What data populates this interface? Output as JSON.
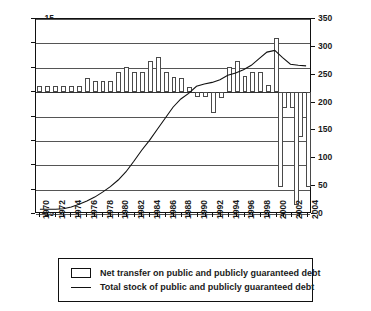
{
  "chart_data": {
    "type": "bar",
    "title": "",
    "subtitle": "",
    "xlabel": "",
    "ylabel": "",
    "grid": true,
    "legend_position": "bottom",
    "x": [
      1970,
      1971,
      1972,
      1973,
      1974,
      1975,
      1976,
      1977,
      1978,
      1979,
      1980,
      1981,
      1982,
      1983,
      1984,
      1985,
      1986,
      1987,
      1988,
      1989,
      1990,
      1991,
      1992,
      1993,
      1994,
      1995,
      1996,
      1997,
      1998,
      1999,
      2000,
      2001,
      2002,
      2003,
      2004
    ],
    "categories": [
      "1970",
      "1971",
      "1972",
      "1973",
      "1974",
      "1975",
      "1976",
      "1977",
      "1978",
      "1979",
      "1980",
      "1981",
      "1982",
      "1983",
      "1984",
      "1985",
      "1986",
      "1987",
      "1988",
      "1989",
      "1990",
      "1991",
      "1992",
      "1993",
      "1994",
      "1995",
      "1996",
      "1997",
      "1998",
      "1999",
      "2000",
      "2001",
      "2002",
      "2003",
      "2004"
    ],
    "xtick_labels": [
      "1970",
      "1972",
      "1974",
      "1976",
      "1978",
      "1980",
      "1982",
      "1984",
      "1986",
      "1988",
      "1990",
      "1992",
      "1994",
      "1996",
      "1998",
      "2000",
      "2002",
      "2004"
    ],
    "left_axis": {
      "ticks": [
        15,
        10,
        5,
        0,
        -5,
        -10,
        -15,
        -20,
        -25
      ],
      "tick_labels": [
        "15",
        "10",
        "5",
        "0",
        "-5",
        "-10",
        "-15",
        "-20",
        "-25"
      ],
      "ylim": [
        -25,
        15
      ]
    },
    "right_axis": {
      "ticks": [
        350,
        300,
        250,
        200,
        150,
        100,
        50,
        0
      ],
      "tick_labels": [
        "350",
        "300",
        "250",
        "200",
        "150",
        "100",
        "50",
        "0"
      ],
      "ylim": [
        0,
        350
      ]
    },
    "series": [
      {
        "name": "Net transfer on public and publicly guaranteed debt",
        "type": "bar",
        "axis": "left",
        "values": [
          1.2,
          1.2,
          1.2,
          1.2,
          1.2,
          1.2,
          3.0,
          2.2,
          2.3,
          2.3,
          4.1,
          5.2,
          4.1,
          4.1,
          6.3,
          7.2,
          4.1,
          3.1,
          2.8,
          1.1,
          -1.0,
          -0.9,
          -4.3,
          -1.3,
          5.2,
          6.3,
          3.3,
          4.1,
          4.1,
          1.4,
          11.2,
          -3.2,
          -3.3,
          -9.2,
          -11.1
        ]
      },
      {
        "name": "Total stock of public and publicly guaranteed debt",
        "type": "line",
        "axis": "right",
        "values": [
          5,
          5,
          5,
          6,
          9,
          14,
          20,
          27,
          36,
          46,
          58,
          73,
          92,
          112,
          130,
          150,
          170,
          190,
          205,
          215,
          228,
          232,
          235,
          240,
          248,
          252,
          258,
          266,
          278,
          290,
          293,
          280,
          268,
          266,
          265
        ]
      }
    ],
    "bars_by_year": [
      {
        "year": "1970",
        "value": 1.2
      },
      {
        "year": "1971",
        "value": 1.2
      },
      {
        "year": "1972",
        "value": 1.2
      },
      {
        "year": "1973",
        "value": 1.2
      },
      {
        "year": "1974",
        "value": 1.2
      },
      {
        "year": "1975",
        "value": 1.2
      },
      {
        "year": "1976",
        "value": 3.0
      },
      {
        "year": "1977",
        "value": 2.2
      },
      {
        "year": "1978",
        "value": 2.3
      },
      {
        "year": "1979",
        "value": 2.3
      },
      {
        "year": "1980",
        "value": 4.1
      },
      {
        "year": "1981",
        "value": 5.2
      },
      {
        "year": "1982",
        "value": 4.1
      },
      {
        "year": "1983",
        "value": 4.1
      },
      {
        "year": "1984",
        "value": 6.3
      },
      {
        "year": "1985",
        "value": 7.2
      },
      {
        "year": "1986",
        "value": 4.1
      },
      {
        "year": "1987",
        "value": 3.1
      },
      {
        "year": "1988",
        "value": 2.8
      },
      {
        "year": "1989",
        "value": 1.1
      },
      {
        "year": "1990",
        "value": -1.0
      },
      {
        "year": "1991",
        "value": -0.9
      },
      {
        "year": "1992",
        "value": -4.3
      },
      {
        "year": "1993",
        "value": -1.3
      },
      {
        "year": "1994",
        "value": 5.2
      },
      {
        "year": "1995",
        "value": 6.3
      },
      {
        "year": "1996",
        "value": 3.3
      },
      {
        "year": "1997",
        "value": 4.1
      },
      {
        "year": "1998",
        "value": 4.1
      },
      {
        "year": "1999",
        "value": 1.4
      },
      {
        "year": "2000",
        "value": 11.2
      },
      {
        "year": "2001",
        "value": -3.2
      },
      {
        "year": "2002",
        "value": -3.3
      },
      {
        "year": "2003",
        "value": -9.2
      },
      {
        "year": "2004",
        "value": -11.1
      }
    ],
    "extra_negative_bars": [
      {
        "value": -19.4
      },
      {
        "value": -23.2
      },
      {
        "value": -19.4
      }
    ],
    "line_peak": {
      "left_value": 8.5,
      "right_value": 293
    },
    "line_start": {
      "left_value": -24.3,
      "right_value": 5
    }
  },
  "legend": {
    "items": [
      {
        "marker": "bar-swatch",
        "label": "Net transfer on public and publicly guaranteed debt"
      },
      {
        "marker": "line-swatch",
        "label": "Total stock of public and publicly guaranteed debt"
      }
    ]
  }
}
